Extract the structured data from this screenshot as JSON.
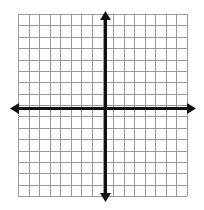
{
  "image": {
    "width": 204,
    "height": 210,
    "background_color": "#ffffff",
    "title": "Blank coordinate plane with grid"
  },
  "chart_data": {
    "type": "scatter",
    "title": "",
    "subtitle": "",
    "xlabel": "",
    "ylabel": "",
    "series": [
      {
        "name": "",
        "x": [],
        "y": []
      }
    ],
    "x": [],
    "values": [],
    "categories": [],
    "xlim": [
      -8,
      8
    ],
    "ylim": [
      -8,
      8
    ],
    "x_tick_labels": [],
    "y_tick_labels": [],
    "grid": true,
    "grid_columns": 16,
    "grid_rows": 16,
    "legend": false,
    "legend_position": "none",
    "annotations": [],
    "axes": {
      "x_axis_visible": true,
      "y_axis_visible": true,
      "x_axis_arrows": [
        "left",
        "right"
      ],
      "y_axis_arrows": [
        "up",
        "down"
      ],
      "origin_x_units": 0,
      "origin_y_units": 0
    }
  },
  "geometry": {
    "grid_left": 18,
    "grid_top": 14,
    "grid_right": 187,
    "grid_bottom": 196,
    "cell_width": 10.5625,
    "cell_height": 11.375,
    "origin_px_x": 105.5,
    "origin_px_y": 105.0,
    "x_axis_y_px": 108,
    "y_axis_x_px": 105,
    "x_axis_start_px": 10,
    "x_axis_end_px": 196,
    "y_axis_start_px": 11,
    "y_axis_end_px": 202
  },
  "style": {
    "grid_line_color": "#9a9a9a",
    "grid_line_width": 1,
    "axis_color": "#111111",
    "axis_line_width": 3,
    "arrow_color": "#111111",
    "background_color": "#ffffff"
  },
  "labels": {
    "x_axis_name": "x-axis",
    "y_axis_name": "y-axis",
    "origin_name": "origin"
  }
}
